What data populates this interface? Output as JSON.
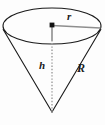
{
  "figure": {
    "kind": "geometry-diagram",
    "shape_name": "cone",
    "orientation": "apex-down",
    "background_color": "#fdfdfd",
    "stroke_color": "#1a1a1a",
    "height_line_color": "#9a9a9a",
    "labels": {
      "radius_top": "r",
      "height": "h",
      "slant_height": "R"
    },
    "geometry": {
      "ellipse_center_x": 52,
      "ellipse_center_y": 26,
      "ellipse_radius_x": 49,
      "ellipse_radius_y": 18,
      "apex_x": 52,
      "apex_y": 112,
      "center_dot_x": 52,
      "center_dot_y": 25,
      "radius_end_x": 101,
      "radius_end_y": 28,
      "left_rim_x": 3,
      "left_rim_y": 30,
      "right_rim_x": 101,
      "right_rim_y": 30
    }
  }
}
